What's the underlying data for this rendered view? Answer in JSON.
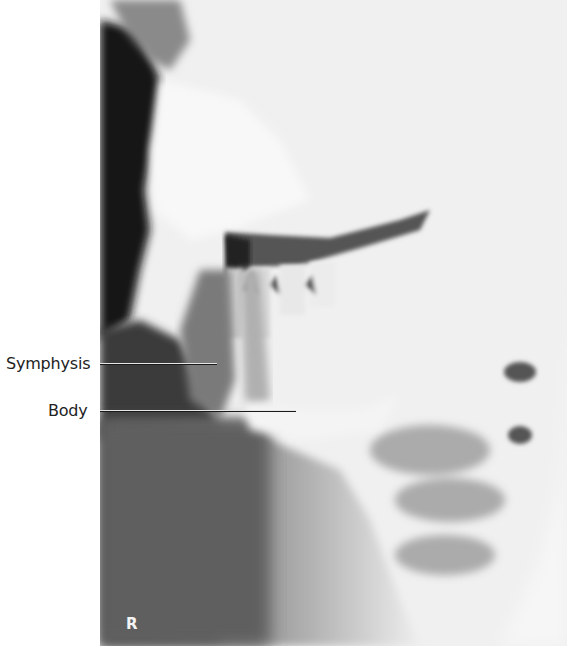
{
  "figure": {
    "side_marker": "R",
    "labels": [
      {
        "id": "symphysis",
        "text": "Symphysis"
      },
      {
        "id": "body",
        "text": "Body"
      }
    ]
  }
}
